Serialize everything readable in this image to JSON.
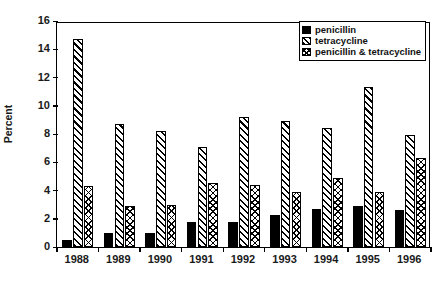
{
  "chart_data": {
    "type": "bar",
    "title": "",
    "subtitle": "",
    "xlabel": "",
    "ylabel": "Percent",
    "categories": [
      "1988",
      "1989",
      "1990",
      "1991",
      "1992",
      "1993",
      "1994",
      "1995",
      "1996"
    ],
    "series": [
      {
        "name": "penicillin",
        "pattern": "solid-black",
        "values": [
          0.5,
          1.0,
          1.0,
          1.8,
          1.8,
          2.3,
          2.7,
          2.9,
          2.6
        ]
      },
      {
        "name": "tetracycline",
        "pattern": "diagonal-hatch",
        "values": [
          14.7,
          8.7,
          8.2,
          7.1,
          9.2,
          8.9,
          8.4,
          11.3,
          7.9
        ]
      },
      {
        "name": "penicillin & tetracycline",
        "pattern": "cross-hatch",
        "values": [
          4.3,
          2.9,
          3.0,
          4.5,
          4.4,
          3.9,
          4.9,
          3.9,
          6.3
        ]
      }
    ],
    "ylim": [
      0,
      16
    ],
    "yticks": [
      0,
      2,
      4,
      6,
      8,
      10,
      12,
      14,
      16
    ],
    "ytick_labels": [
      "0",
      "2",
      "4",
      "6",
      "8",
      "10",
      "12",
      "14",
      "16"
    ],
    "grid": false,
    "legend_position": "top-right",
    "frame": true
  },
  "legend": {
    "entries": [
      {
        "label": "penicillin"
      },
      {
        "label": "tetracycline"
      },
      {
        "label": "penicillin & tetracycline"
      }
    ]
  }
}
